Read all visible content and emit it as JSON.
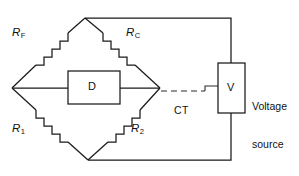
{
  "diagram": {
    "type": "circuit-schematic",
    "background_color": "#ffffff",
    "line_color": "#1a1a1a"
  },
  "labels": {
    "resistor_rf": "R",
    "resistor_rf_sub": "F",
    "resistor_rc": "R",
    "resistor_rc_sub": "C",
    "resistor_r1": "R",
    "resistor_r1_sub": "1",
    "resistor_r2": "R",
    "resistor_r2_sub": "2",
    "detector": "D",
    "voltmeter": "V",
    "ct": "CT",
    "voltage_source_line1": "Voltage",
    "voltage_source_line2": "source"
  },
  "components": [
    {
      "name": "resistor-rf",
      "label": "RF",
      "position": "upper-left-arm"
    },
    {
      "name": "resistor-rc",
      "label": "RC",
      "position": "upper-right-arm"
    },
    {
      "name": "resistor-r1",
      "label": "R1",
      "position": "lower-left-arm"
    },
    {
      "name": "resistor-r2",
      "label": "R2",
      "position": "lower-right-arm"
    },
    {
      "name": "detector-box",
      "label": "D",
      "position": "bridge-diagonal"
    },
    {
      "name": "voltmeter-box",
      "label": "V",
      "position": "right-side"
    }
  ],
  "connections": [
    {
      "name": "top-node-to-source",
      "style": "solid"
    },
    {
      "name": "bottom-node-to-source",
      "style": "solid"
    },
    {
      "name": "ct-dashed-link",
      "style": "dashed",
      "label": "CT"
    }
  ]
}
